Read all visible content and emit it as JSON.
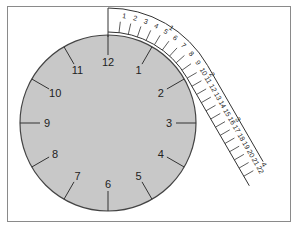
{
  "diagram": {
    "type": "clock-with-curved-scale",
    "clock": {
      "face_color": "#c8c8c8",
      "outline_color": "#444444",
      "hour_labels": [
        "12",
        "1",
        "2",
        "3",
        "4",
        "5",
        "6",
        "7",
        "8",
        "9",
        "10",
        "11"
      ]
    },
    "scale": {
      "outer_labels": [
        "1",
        "2",
        "3",
        "4"
      ],
      "inner_labels": [
        "1",
        "2",
        "3",
        "4",
        "5",
        "6",
        "7",
        "8",
        "9",
        "10",
        "11",
        "12",
        "13",
        "14",
        "15",
        "16",
        "17",
        "18",
        "19",
        "20",
        "21",
        "22"
      ],
      "line_color": "#333333"
    }
  }
}
